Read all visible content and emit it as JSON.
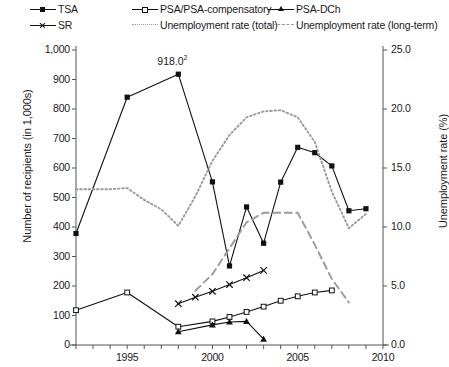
{
  "legend": {
    "items": [
      {
        "label": "TSA",
        "style": "solid-square",
        "col": 0,
        "row": 0
      },
      {
        "label": "PSA/PSA-compensatory",
        "style": "solid-open-square",
        "col": 1,
        "row": 0
      },
      {
        "label": "PSA-DCh",
        "style": "solid-triangle",
        "col": 2,
        "row": 0
      },
      {
        "label": "SR",
        "style": "solid-x",
        "col": 0,
        "row": 1
      },
      {
        "label": "Unemployment rate (total)",
        "style": "dotted",
        "col": 1,
        "row": 1
      },
      {
        "label": "Unemployment rate (long-term)",
        "style": "dashed",
        "col": 2,
        "row": 1
      }
    ]
  },
  "axes": {
    "y_left_label": "Number of recipients (in 1,000s)",
    "y_right_label": "Unemployment rate (%)",
    "y_left_ticks": [
      "0",
      "100",
      "200",
      "300",
      "400",
      "500",
      "600",
      "700",
      "800",
      "900",
      "1,000"
    ],
    "y_right_ticks": [
      "0.0",
      "5.0",
      "10.0",
      "15.0",
      "20.0",
      "25.0"
    ],
    "x_ticks": [
      "1995",
      "2000",
      "2005",
      "2010"
    ]
  },
  "annotations": [
    {
      "text": "918.0",
      "sup": "2",
      "x": 1998,
      "y": 918
    }
  ],
  "colors": {
    "series_dark": "#111111",
    "unemployment_gray": "#9a9a9a",
    "axis": "#555555"
  },
  "chart_data": {
    "type": "line",
    "title": "",
    "xlabel": "",
    "ylabel": "Number of recipients (in 1,000s)",
    "y2label": "Unemployment rate (%)",
    "xlim": [
      1992,
      2010
    ],
    "ylim": [
      0,
      1000
    ],
    "y2lim": [
      0,
      25
    ],
    "grid": false,
    "legend_position": "top",
    "series": [
      {
        "name": "TSA",
        "axis": "left",
        "marker": "filled-square",
        "linestyle": "solid",
        "x": [
          1992,
          1995,
          1998,
          2000,
          2001,
          2002,
          2003,
          2004,
          2005,
          2006,
          2007,
          2008,
          2009
        ],
        "values": [
          378,
          840,
          918,
          553,
          268,
          468,
          345,
          552,
          670,
          652,
          607,
          455,
          462
        ]
      },
      {
        "name": "PSA/PSA-compensatory",
        "axis": "left",
        "marker": "open-square",
        "linestyle": "solid",
        "x": [
          1992,
          1995,
          1998,
          2000,
          2001,
          2002,
          2003,
          2004,
          2005,
          2006,
          2007
        ],
        "values": [
          118,
          178,
          62,
          80,
          95,
          112,
          130,
          150,
          165,
          178,
          185
        ]
      },
      {
        "name": "PSA-DCh",
        "axis": "left",
        "marker": "filled-triangle",
        "linestyle": "solid",
        "x": [
          1998,
          2000,
          2001,
          2002,
          2003
        ],
        "values": [
          45,
          68,
          78,
          80,
          20
        ]
      },
      {
        "name": "SR",
        "axis": "left",
        "marker": "x",
        "linestyle": "solid",
        "x": [
          1998,
          1999,
          2000,
          2001,
          2002,
          2003
        ],
        "values": [
          140,
          162,
          182,
          205,
          228,
          253
        ]
      },
      {
        "name": "Unemployment rate (total)",
        "axis": "right",
        "marker": "none",
        "linestyle": "dotted",
        "x": [
          1992,
          1993,
          1994,
          1995,
          1996,
          1997,
          1998,
          1999,
          2000,
          2001,
          2002,
          2003,
          2004,
          2005,
          2006,
          2007,
          2008,
          2009
        ],
        "values": [
          13.2,
          13.2,
          13.2,
          13.3,
          12.3,
          11.5,
          10.1,
          12.6,
          15.6,
          17.8,
          19.3,
          19.8,
          19.9,
          19.3,
          17.2,
          13.0,
          9.9,
          11.1
        ]
      },
      {
        "name": "Unemployment rate (long-term)",
        "axis": "right",
        "marker": "none",
        "linestyle": "dashed",
        "x": [
          1999,
          2000,
          2001,
          2002,
          2003,
          2004,
          2005,
          2006,
          2007,
          2008
        ],
        "values": [
          4.6,
          6.0,
          8.2,
          10.4,
          11.2,
          11.2,
          11.2,
          8.5,
          5.6,
          3.6
        ]
      }
    ]
  }
}
